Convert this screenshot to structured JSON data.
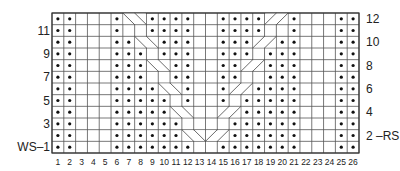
{
  "chart_data": {
    "type": "table",
    "columns": 26,
    "rows": 12,
    "column_labels": [
      "1",
      "2",
      "3",
      "4",
      "5",
      "6",
      "7",
      "8",
      "9",
      "10",
      "11",
      "12",
      "13",
      "14",
      "15",
      "16",
      "17",
      "18",
      "19",
      "20",
      "21",
      "22",
      "23",
      "24",
      "25",
      "26"
    ],
    "row_labels_right": [
      {
        "row": 12,
        "label": "12"
      },
      {
        "row": 10,
        "label": "10"
      },
      {
        "row": 8,
        "label": "8"
      },
      {
        "row": 6,
        "label": "6"
      },
      {
        "row": 4,
        "label": "4"
      },
      {
        "row": 2,
        "label": "2 –RS"
      }
    ],
    "row_labels_left": [
      {
        "row": 11,
        "label": "11"
      },
      {
        "row": 9,
        "label": "9"
      },
      {
        "row": 7,
        "label": "7"
      },
      {
        "row": 5,
        "label": "5"
      },
      {
        "row": 3,
        "label": "3"
      },
      {
        "row": 1,
        "label": "WS–1"
      }
    ],
    "legend": {
      "dot": "purl",
      "blank": "knit",
      "backslash_cable": "2-st cable crossing (left panel)",
      "slash_cable": "2-st cable crossing (right panel)"
    },
    "grid_rows_top_to_bottom": [
      {
        "row": 12,
        "dots": [
          1,
          2,
          6,
          9,
          10,
          11,
          12,
          15,
          16,
          17,
          18,
          21,
          25,
          26
        ],
        "cables": [
          {
            "cols": [
              7,
              8
            ],
            "dir": "\\"
          },
          {
            "cols": [
              19,
              20
            ],
            "dir": "/"
          }
        ]
      },
      {
        "row": 11,
        "dots": [
          1,
          2,
          6,
          9,
          10,
          11,
          12,
          15,
          16,
          17,
          18,
          21,
          25,
          26
        ],
        "cables": []
      },
      {
        "row": 10,
        "dots": [
          1,
          2,
          6,
          7,
          10,
          11,
          12,
          15,
          16,
          17,
          20,
          21,
          25,
          26
        ],
        "cables": [
          {
            "cols": [
              8,
              9
            ],
            "dir": "\\"
          },
          {
            "cols": [
              18,
              19
            ],
            "dir": "/"
          }
        ]
      },
      {
        "row": 9,
        "dots": [
          1,
          2,
          6,
          7,
          8,
          10,
          11,
          12,
          15,
          16,
          17,
          19,
          20,
          21,
          25,
          26
        ],
        "cables": []
      },
      {
        "row": 8,
        "dots": [
          1,
          2,
          6,
          7,
          8,
          11,
          12,
          15,
          16,
          19,
          20,
          21,
          25,
          26
        ],
        "cables": [
          {
            "cols": [
              9,
              10
            ],
            "dir": "\\"
          },
          {
            "cols": [
              17,
              18
            ],
            "dir": "/"
          }
        ]
      },
      {
        "row": 7,
        "dots": [
          1,
          2,
          6,
          7,
          8,
          11,
          12,
          15,
          16,
          19,
          20,
          21,
          25,
          26
        ],
        "cables": []
      },
      {
        "row": 6,
        "dots": [
          1,
          2,
          6,
          7,
          8,
          9,
          12,
          15,
          18,
          19,
          20,
          21,
          25,
          26
        ],
        "cables": [
          {
            "cols": [
              10,
              11
            ],
            "dir": "\\"
          },
          {
            "cols": [
              16,
              17
            ],
            "dir": "/"
          }
        ]
      },
      {
        "row": 5,
        "dots": [
          1,
          2,
          6,
          7,
          8,
          9,
          10,
          12,
          15,
          17,
          18,
          19,
          20,
          21,
          25,
          26
        ],
        "cables": []
      },
      {
        "row": 4,
        "dots": [
          1,
          2,
          6,
          7,
          8,
          9,
          10,
          17,
          18,
          19,
          20,
          21,
          25,
          26
        ],
        "cables": [
          {
            "cols": [
              11,
              12
            ],
            "dir": "\\"
          },
          {
            "cols": [
              15,
              16
            ],
            "dir": "/"
          }
        ]
      },
      {
        "row": 3,
        "dots": [
          1,
          2,
          6,
          7,
          8,
          9,
          10,
          11,
          16,
          17,
          18,
          19,
          20,
          21,
          25,
          26
        ],
        "cables": []
      },
      {
        "row": 2,
        "dots": [
          1,
          2,
          6,
          7,
          8,
          9,
          10,
          11,
          16,
          17,
          18,
          19,
          20,
          21,
          25,
          26
        ],
        "cables": [
          {
            "cols": [
              12,
              13
            ],
            "dir": "\\"
          },
          {
            "cols": [
              14,
              15
            ],
            "dir": "/"
          }
        ]
      },
      {
        "row": 1,
        "dots": [
          1,
          2,
          6,
          7,
          8,
          9,
          10,
          11,
          12,
          15,
          16,
          17,
          18,
          19,
          20,
          21,
          25,
          26
        ],
        "cables": []
      }
    ]
  },
  "style": {
    "grid_color": "#555555",
    "dot_color": "#111111",
    "cable_color": "#444444"
  }
}
